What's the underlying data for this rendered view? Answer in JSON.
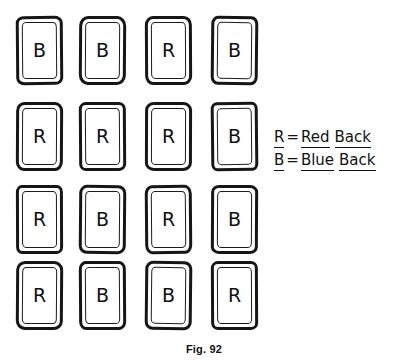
{
  "figure": {
    "caption": "Fig. 92",
    "grid": {
      "rows": 4,
      "cols": 4,
      "cards": [
        [
          {
            "letter": "B"
          },
          {
            "letter": "B"
          },
          {
            "letter": "R"
          },
          {
            "letter": "B"
          }
        ],
        [
          {
            "letter": "R"
          },
          {
            "letter": "R"
          },
          {
            "letter": "R"
          },
          {
            "letter": "B"
          }
        ],
        [
          {
            "letter": "R"
          },
          {
            "letter": "B"
          },
          {
            "letter": "R"
          },
          {
            "letter": "B"
          }
        ],
        [
          {
            "letter": "R"
          },
          {
            "letter": "B"
          },
          {
            "letter": "B"
          },
          {
            "letter": "R"
          }
        ]
      ]
    },
    "legend": {
      "lines": [
        {
          "key": "R",
          "equals": "=",
          "word1": "Red",
          "word2": "Back"
        },
        {
          "key": "B",
          "equals": "=",
          "word1": "Blue",
          "word2": "Back"
        }
      ]
    }
  },
  "colors": {
    "ink": "#161616",
    "paper": "#ffffff"
  }
}
